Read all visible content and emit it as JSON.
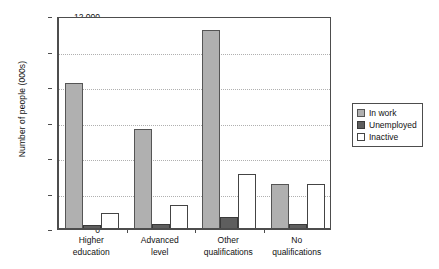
{
  "chart_data": {
    "type": "bar",
    "title": "",
    "xlabel": "",
    "ylabel": "Number of people (000s)",
    "ylim": [
      0,
      12000
    ],
    "ytick_labels": [
      "0",
      "2 000",
      "4 000",
      "6 000",
      "8 000",
      "10 000",
      "12 000"
    ],
    "ytick_values": [
      0,
      2000,
      4000,
      6000,
      8000,
      10000,
      12000
    ],
    "grid": true,
    "legend_position": "right",
    "categories": [
      "Higher education",
      "Advanced level",
      "Other qualifications",
      "No qualifications"
    ],
    "category_lines": [
      [
        "Higher",
        "education"
      ],
      [
        "Advanced",
        "level"
      ],
      [
        "Other",
        "qualifications"
      ],
      [
        "No",
        "qualifications"
      ]
    ],
    "series": [
      {
        "name": "In work",
        "color": "#b0b0b0",
        "values": [
          8200,
          5650,
          11200,
          2550
        ]
      },
      {
        "name": "Unemployed",
        "color": "#5e5e5e",
        "values": [
          250,
          280,
          700,
          300
        ]
      },
      {
        "name": "Inactive",
        "color": "#ffffff",
        "values": [
          900,
          1330,
          3100,
          2550
        ]
      }
    ]
  },
  "legend": {
    "items": [
      {
        "label": "In work"
      },
      {
        "label": "Unemployed"
      },
      {
        "label": "Inactive"
      }
    ]
  }
}
